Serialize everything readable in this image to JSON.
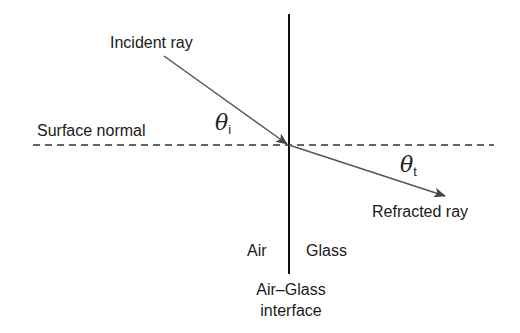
{
  "diagram": {
    "labels": {
      "incident_ray": "Incident ray",
      "surface_normal": "Surface normal",
      "refracted_ray": "Refracted ray",
      "air": "Air",
      "glass": "Glass",
      "interface_line1": "Air–Glass",
      "interface_line2": "interface"
    },
    "angles": {
      "incident_symbol": "θ",
      "incident_subscript": "i",
      "transmitted_symbol": "θ",
      "transmitted_subscript": "t"
    },
    "colors": {
      "interface": "#111111",
      "rays": "#555555",
      "normal": "#333333"
    }
  }
}
